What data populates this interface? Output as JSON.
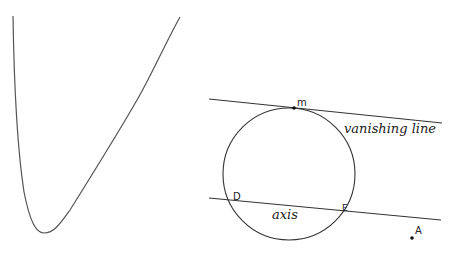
{
  "diagram": {
    "curve": {
      "name": "convex-curve",
      "stroke": "#555555"
    },
    "circle": {
      "cx": 289,
      "cy": 174,
      "r": 66,
      "stroke": "#333333"
    },
    "lines": [
      {
        "name": "vanishing-line",
        "label": "vanishing line",
        "x1": 209,
        "y1": 99,
        "x2": 442,
        "y2": 123
      },
      {
        "name": "axis",
        "label": "axis",
        "x1": 209,
        "y1": 198,
        "x2": 441,
        "y2": 220
      }
    ],
    "points": [
      {
        "label": "m",
        "x": 294,
        "y": 108
      },
      {
        "label": "D",
        "x": 230,
        "y": 200
      },
      {
        "label": "E",
        "x": 341,
        "y": 209
      },
      {
        "label": "A",
        "x": 412,
        "y": 238
      }
    ]
  }
}
